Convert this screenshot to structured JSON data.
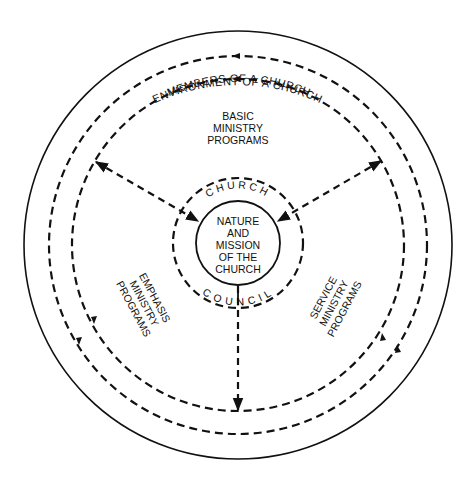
{
  "diagram": {
    "colors": {
      "ink": "#111111",
      "background": "#ffffff"
    },
    "rings": {
      "environment": {
        "label": "ENVIRONMENT OF A CHURCH",
        "style": "solid"
      },
      "members": {
        "label": "MEMBERS OF A CHURCH",
        "style": "dashed"
      },
      "church_council": {
        "top_label": "CHURCH",
        "bottom_label": "COUNCIL",
        "style": "dashed"
      }
    },
    "center": {
      "lines": [
        "NATURE",
        "AND",
        "MISSION",
        "OF THE",
        "CHURCH"
      ]
    },
    "sectors": {
      "basic": {
        "lines": [
          "BASIC",
          "MINISTRY",
          "PROGRAMS"
        ]
      },
      "emphasis": {
        "lines": [
          "EMPHASIS",
          "MINISTRY",
          "PROGRAMS"
        ]
      },
      "service": {
        "lines": [
          "SERVICE",
          "MINISTRY",
          "PROGRAMS"
        ]
      }
    },
    "connectors": [
      {
        "from": "basic/emphasis boundary",
        "to": "center",
        "style": "dashed double-arrow"
      },
      {
        "from": "basic/service boundary",
        "to": "center",
        "style": "dashed double-arrow"
      },
      {
        "from": "center",
        "to": "emphasis/service boundary",
        "style": "dashed arrow"
      }
    ]
  }
}
